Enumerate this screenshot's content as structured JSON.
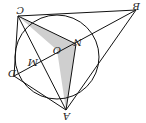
{
  "diagram": {
    "orientation": "rotated 180 degrees",
    "points": {
      "C": {
        "label": "C",
        "x": 18,
        "y": 16
      },
      "B": {
        "label": "B",
        "x": 136,
        "y": 10
      },
      "D": {
        "label": "D",
        "x": 14,
        "y": 76
      },
      "A": {
        "label": "A",
        "x": 66,
        "y": 110
      },
      "O": {
        "label": "O",
        "x": 57,
        "y": 50
      },
      "N": {
        "label": "N",
        "x": 76,
        "y": 44
      },
      "M": {
        "label": "M",
        "x": 34,
        "y": 62
      }
    },
    "circle": {
      "cx": 57,
      "cy": 57,
      "r": 42
    },
    "shaded_region": "triangle C-N-A (quadrilateral C N A O shaded)",
    "colors": {
      "stroke": "#111111",
      "shade": "#cfcfcf"
    }
  }
}
